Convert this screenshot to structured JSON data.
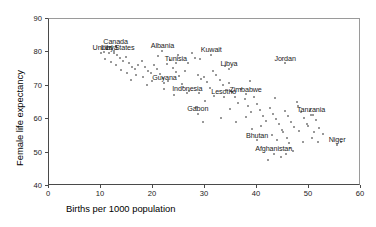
{
  "chart_data": {
    "type": "scatter",
    "title": "",
    "xlabel": "Births per 1000 population",
    "ylabel": "Female life expectancy",
    "xlim": [
      0,
      60
    ],
    "ylim": [
      40,
      90
    ],
    "xticks": [
      0,
      10,
      20,
      30,
      40,
      50,
      60
    ],
    "yticks": [
      40,
      50,
      60,
      70,
      80,
      90
    ],
    "grid": false,
    "legend": null,
    "marker_color": "#777777",
    "points": [
      {
        "x": 10.2,
        "y": 79.4
      },
      {
        "x": 10.8,
        "y": 79.9
      },
      {
        "x": 11.4,
        "y": 80.6
      },
      {
        "x": 12.0,
        "y": 81.2
      },
      {
        "x": 12.6,
        "y": 80.2
      },
      {
        "x": 13.2,
        "y": 79.0
      },
      {
        "x": 13.8,
        "y": 78.1
      },
      {
        "x": 11.0,
        "y": 77.6
      },
      {
        "x": 12.2,
        "y": 76.8
      },
      {
        "x": 13.0,
        "y": 75.9
      },
      {
        "x": 14.4,
        "y": 77.2
      },
      {
        "x": 15.0,
        "y": 78.4
      },
      {
        "x": 15.6,
        "y": 76.4
      },
      {
        "x": 16.2,
        "y": 75.2
      },
      {
        "x": 14.0,
        "y": 74.4
      },
      {
        "x": 15.2,
        "y": 73.6
      },
      {
        "x": 16.8,
        "y": 74.8
      },
      {
        "x": 17.4,
        "y": 76.0
      },
      {
        "x": 18.0,
        "y": 77.0
      },
      {
        "x": 18.6,
        "y": 75.4
      },
      {
        "x": 19.2,
        "y": 74.0
      },
      {
        "x": 17.0,
        "y": 73.0
      },
      {
        "x": 18.2,
        "y": 72.2
      },
      {
        "x": 19.8,
        "y": 73.4
      },
      {
        "x": 20.4,
        "y": 75.8
      },
      {
        "x": 21.0,
        "y": 74.6
      },
      {
        "x": 21.6,
        "y": 73.2
      },
      {
        "x": 22.2,
        "y": 72.0
      },
      {
        "x": 20.0,
        "y": 71.2
      },
      {
        "x": 22.8,
        "y": 76.2
      },
      {
        "x": 23.4,
        "y": 77.4
      },
      {
        "x": 24.0,
        "y": 75.0
      },
      {
        "x": 24.6,
        "y": 73.8
      },
      {
        "x": 25.2,
        "y": 72.6
      },
      {
        "x": 23.0,
        "y": 71.0
      },
      {
        "x": 25.8,
        "y": 70.2
      },
      {
        "x": 26.4,
        "y": 74.2
      },
      {
        "x": 27.0,
        "y": 76.6
      },
      {
        "x": 27.6,
        "y": 79.6
      },
      {
        "x": 28.2,
        "y": 78.0
      },
      {
        "x": 28.8,
        "y": 73.0
      },
      {
        "x": 29.4,
        "y": 71.8
      },
      {
        "x": 26.0,
        "y": 69.4
      },
      {
        "x": 27.2,
        "y": 68.2
      },
      {
        "x": 30.0,
        "y": 72.4
      },
      {
        "x": 30.6,
        "y": 70.8
      },
      {
        "x": 31.2,
        "y": 69.0
      },
      {
        "x": 29.0,
        "y": 67.4
      },
      {
        "x": 31.8,
        "y": 74.0
      },
      {
        "x": 32.4,
        "y": 72.8
      },
      {
        "x": 33.0,
        "y": 71.4
      },
      {
        "x": 33.6,
        "y": 69.8
      },
      {
        "x": 34.2,
        "y": 68.4
      },
      {
        "x": 32.0,
        "y": 66.6
      },
      {
        "x": 30.2,
        "y": 65.2
      },
      {
        "x": 28.4,
        "y": 63.4
      },
      {
        "x": 34.8,
        "y": 70.4
      },
      {
        "x": 35.4,
        "y": 67.8
      },
      {
        "x": 36.0,
        "y": 66.2
      },
      {
        "x": 36.6,
        "y": 64.6
      },
      {
        "x": 35.0,
        "y": 62.8
      },
      {
        "x": 37.2,
        "y": 68.8
      },
      {
        "x": 37.8,
        "y": 65.8
      },
      {
        "x": 38.4,
        "y": 63.8
      },
      {
        "x": 39.0,
        "y": 62.0
      },
      {
        "x": 38.0,
        "y": 60.4
      },
      {
        "x": 39.6,
        "y": 66.4
      },
      {
        "x": 40.2,
        "y": 64.2
      },
      {
        "x": 40.8,
        "y": 62.4
      },
      {
        "x": 41.4,
        "y": 60.8
      },
      {
        "x": 42.0,
        "y": 59.2
      },
      {
        "x": 41.0,
        "y": 57.6
      },
      {
        "x": 42.6,
        "y": 63.0
      },
      {
        "x": 43.2,
        "y": 61.4
      },
      {
        "x": 43.8,
        "y": 59.8
      },
      {
        "x": 44.4,
        "y": 58.2
      },
      {
        "x": 45.0,
        "y": 56.6
      },
      {
        "x": 43.0,
        "y": 55.0
      },
      {
        "x": 44.0,
        "y": 53.6
      },
      {
        "x": 45.6,
        "y": 62.2
      },
      {
        "x": 46.2,
        "y": 60.6
      },
      {
        "x": 46.8,
        "y": 59.0
      },
      {
        "x": 47.4,
        "y": 57.4
      },
      {
        "x": 45.2,
        "y": 55.8
      },
      {
        "x": 46.0,
        "y": 54.2
      },
      {
        "x": 46.4,
        "y": 52.6
      },
      {
        "x": 46.6,
        "y": 51.0
      },
      {
        "x": 48.0,
        "y": 63.6
      },
      {
        "x": 48.6,
        "y": 61.8
      },
      {
        "x": 49.2,
        "y": 60.0
      },
      {
        "x": 49.8,
        "y": 58.4
      },
      {
        "x": 48.2,
        "y": 56.2
      },
      {
        "x": 50.4,
        "y": 62.6
      },
      {
        "x": 51.0,
        "y": 61.0
      },
      {
        "x": 51.6,
        "y": 59.4
      },
      {
        "x": 50.0,
        "y": 57.8
      },
      {
        "x": 51.2,
        "y": 56.0
      },
      {
        "x": 52.2,
        "y": 57.0
      },
      {
        "x": 52.8,
        "y": 55.4
      },
      {
        "x": 50.8,
        "y": 54.0
      },
      {
        "x": 49.0,
        "y": 52.8
      },
      {
        "x": 47.2,
        "y": 50.2
      },
      {
        "x": 56.4,
        "y": 52.8
      },
      {
        "x": 44.8,
        "y": 48.4
      },
      {
        "x": 42.4,
        "y": 47.6
      },
      {
        "x": 45.8,
        "y": 49.4
      },
      {
        "x": 39.2,
        "y": 56.8
      },
      {
        "x": 36.2,
        "y": 58.8
      },
      {
        "x": 33.2,
        "y": 60.2
      },
      {
        "x": 29.8,
        "y": 59.0
      },
      {
        "x": 24.2,
        "y": 67.0
      },
      {
        "x": 22.4,
        "y": 68.6
      },
      {
        "x": 19.0,
        "y": 70.0
      },
      {
        "x": 16.0,
        "y": 71.4
      },
      {
        "x": 21.2,
        "y": 78.6
      },
      {
        "x": 25.0,
        "y": 78.8
      },
      {
        "x": 29.2,
        "y": 77.6
      },
      {
        "x": 34.0,
        "y": 75.6
      },
      {
        "x": 38.8,
        "y": 71.0
      },
      {
        "x": 43.6,
        "y": 66.0
      },
      {
        "x": 47.8,
        "y": 64.8
      },
      {
        "x": 52.0,
        "y": 53.0
      }
    ],
    "labeled_points": [
      {
        "label": "Canada",
        "x": 13.0,
        "y": 81.6
      },
      {
        "label": "United States",
        "x": 12.6,
        "y": 79.6
      },
      {
        "label": "Libya",
        "x": 11.8,
        "y": 79.6
      },
      {
        "label": "Albania",
        "x": 22.0,
        "y": 80.2
      },
      {
        "label": "Tunisia",
        "x": 24.6,
        "y": 76.4
      },
      {
        "label": "Kuwait",
        "x": 31.4,
        "y": 79.0
      },
      {
        "label": "Libya",
        "x": 34.8,
        "y": 74.8
      },
      {
        "label": "Jordan",
        "x": 45.6,
        "y": 76.4
      },
      {
        "label": "Guyana",
        "x": 22.4,
        "y": 70.6
      },
      {
        "label": "Indonesia",
        "x": 26.8,
        "y": 67.4
      },
      {
        "label": "Lesotho",
        "x": 33.8,
        "y": 66.4
      },
      {
        "label": "Zimbabwe",
        "x": 38.0,
        "y": 67.2
      },
      {
        "label": "Gabon",
        "x": 28.8,
        "y": 61.4
      },
      {
        "label": "Tanzania",
        "x": 50.6,
        "y": 61.0
      },
      {
        "label": "Bhutan",
        "x": 40.2,
        "y": 53.4
      },
      {
        "label": "Afghanistan",
        "x": 43.4,
        "y": 49.4
      },
      {
        "label": "Niger",
        "x": 55.6,
        "y": 52.0
      }
    ]
  }
}
